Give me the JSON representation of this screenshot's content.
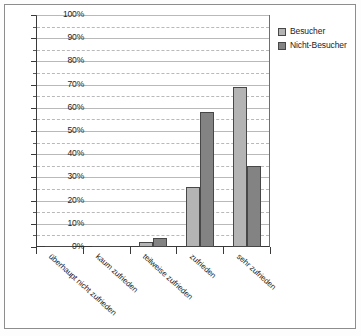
{
  "chart_data": {
    "type": "bar",
    "title": "",
    "subtitle": "",
    "xlabel": "",
    "ylabel": "",
    "ylim": [
      0,
      100
    ],
    "ytick_labels": [
      "0%",
      "10%",
      "20%",
      "30%",
      "40%",
      "50%",
      "60%",
      "70%",
      "80%",
      "90%",
      "100%"
    ],
    "ytick_values": [
      0,
      10,
      20,
      30,
      40,
      50,
      60,
      70,
      80,
      90,
      100
    ],
    "yminor_values": [
      5,
      15,
      25,
      35,
      45,
      55,
      65,
      75,
      85,
      95
    ],
    "grid": "horizontal",
    "legend_position": "right",
    "units": "percent",
    "categories": [
      "überhaupt nicht zufrieden",
      "kaum zufrieden",
      "teilweise zufrieden",
      "zufrieden",
      "sehr zufrieden"
    ],
    "series": [
      {
        "name": "Besucher",
        "color": "#b4b4b4",
        "values": [
          0,
          0,
          2,
          26,
          69
        ]
      },
      {
        "name": "Nicht-Besucher",
        "color": "#838383",
        "values": [
          0,
          0,
          4,
          58,
          35
        ]
      }
    ]
  },
  "legend": {
    "items": [
      {
        "label": "Besucher"
      },
      {
        "label": "Nicht-Besucher"
      }
    ]
  }
}
